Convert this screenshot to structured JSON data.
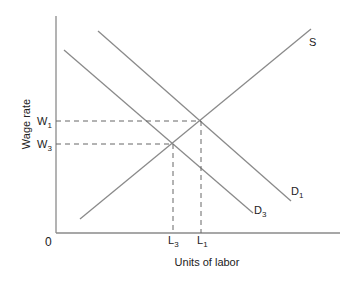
{
  "diagram": {
    "type": "labor-market supply-demand",
    "y_axis_label": "Wage rate",
    "x_axis_label": "Units of labor",
    "origin_label": "0",
    "curves": [
      {
        "name": "S",
        "label": "S",
        "sub": ""
      },
      {
        "name": "D1",
        "label": "D",
        "sub": "1"
      },
      {
        "name": "D3",
        "label": "D",
        "sub": "3"
      }
    ],
    "y_ticks": [
      {
        "label": "W",
        "sub": "1"
      },
      {
        "label": "W",
        "sub": "3"
      }
    ],
    "x_ticks": [
      {
        "label": "L",
        "sub": "3"
      },
      {
        "label": "L",
        "sub": "1"
      }
    ],
    "colors": {
      "line": "#8a8a8a",
      "axis": "#8a8a8a",
      "text": "#222222",
      "s_label": "#3a3a6a"
    }
  }
}
